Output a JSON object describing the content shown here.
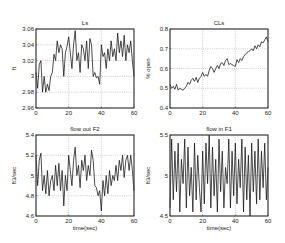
{
  "figure": {
    "background": "#ffffff",
    "line_color": "#111111"
  },
  "chart_data": [
    {
      "type": "line",
      "title": "Ls",
      "xlabel": "",
      "ylabel": "ft",
      "xlim": [
        0,
        60
      ],
      "ylim": [
        2.96,
        3.06
      ],
      "xticks": [
        0,
        20,
        40,
        60
      ],
      "xtick_labels": [
        "0",
        "20",
        "40",
        "60"
      ],
      "yticks": [
        2.96,
        2.98,
        3.0,
        3.02,
        3.04,
        3.06
      ],
      "ytick_labels": [
        "2.96",
        "2.98",
        "3",
        "3.02",
        "3.04",
        "3.06"
      ],
      "grid": true,
      "box": {
        "left": 36,
        "top": 29,
        "right": 134,
        "bottom": 108
      },
      "x": [
        0,
        1,
        2,
        3,
        4,
        5,
        6,
        7,
        8,
        9,
        10,
        11,
        12,
        13,
        14,
        15,
        16,
        17,
        18,
        19,
        20,
        21,
        22,
        23,
        24,
        25,
        26,
        27,
        28,
        29,
        30,
        31,
        32,
        33,
        34,
        35,
        36,
        37,
        38,
        39,
        40,
        41,
        42,
        43,
        44,
        45,
        46,
        47,
        48,
        49,
        50,
        51,
        52,
        53,
        54,
        55,
        56,
        57,
        58,
        59,
        60
      ],
      "values": [
        3.005,
        2.985,
        3.015,
        3.02,
        2.98,
        3.0,
        2.98,
        2.99,
        2.982,
        3.0,
        3.005,
        3.028,
        3.02,
        3.045,
        3.03,
        3.04,
        3.035,
        3.0,
        3.03,
        3.038,
        3.05,
        3.03,
        3.01,
        3.04,
        3.058,
        3.02,
        3.03,
        3.005,
        3.04,
        3.035,
        3.02,
        3.045,
        3.01,
        3.048,
        3.04,
        3.0,
        3.005,
        2.998,
        3.0,
        2.99,
        3.04,
        3.025,
        3.03,
        3.01,
        3.035,
        3.02,
        3.045,
        3.025,
        3.035,
        3.02,
        3.055,
        3.03,
        3.045,
        3.025,
        3.052,
        3.02,
        3.04,
        3.03,
        3.045,
        3.02,
        3.0
      ]
    },
    {
      "type": "line",
      "title": "CLs",
      "xlabel": "",
      "ylabel": "% open",
      "xlim": [
        0,
        60
      ],
      "ylim": [
        0.4,
        0.8
      ],
      "xticks": [
        0,
        20,
        40,
        60
      ],
      "xtick_labels": [
        "0",
        "20",
        "40",
        "60"
      ],
      "yticks": [
        0.4,
        0.5,
        0.6,
        0.7,
        0.8
      ],
      "ytick_labels": [
        "0.4",
        "0.5",
        "0.6",
        "0.7",
        "0.8"
      ],
      "grid": true,
      "box": {
        "left": 170,
        "top": 29,
        "right": 268,
        "bottom": 108
      },
      "x": [
        0,
        1,
        2,
        3,
        4,
        5,
        6,
        7,
        8,
        9,
        10,
        11,
        12,
        13,
        14,
        15,
        16,
        17,
        18,
        19,
        20,
        21,
        22,
        23,
        24,
        25,
        26,
        27,
        28,
        29,
        30,
        31,
        32,
        33,
        34,
        35,
        36,
        37,
        38,
        39,
        40,
        41,
        42,
        43,
        44,
        45,
        46,
        47,
        48,
        49,
        50,
        51,
        52,
        53,
        54,
        55,
        56,
        57,
        58,
        59,
        60
      ],
      "values": [
        0.52,
        0.5,
        0.51,
        0.495,
        0.52,
        0.49,
        0.5,
        0.495,
        0.49,
        0.5,
        0.51,
        0.53,
        0.52,
        0.54,
        0.55,
        0.535,
        0.555,
        0.53,
        0.55,
        0.56,
        0.58,
        0.56,
        0.57,
        0.56,
        0.59,
        0.61,
        0.6,
        0.58,
        0.6,
        0.615,
        0.6,
        0.625,
        0.63,
        0.615,
        0.64,
        0.65,
        0.62,
        0.625,
        0.62,
        0.615,
        0.61,
        0.645,
        0.63,
        0.65,
        0.64,
        0.66,
        0.67,
        0.68,
        0.685,
        0.69,
        0.7,
        0.69,
        0.715,
        0.7,
        0.72,
        0.71,
        0.735,
        0.73,
        0.745,
        0.76,
        0.735
      ]
    },
    {
      "type": "line",
      "title": "flow out F2",
      "xlabel": "time(sec)",
      "ylabel": "ft3/sec",
      "xlim": [
        0,
        60
      ],
      "ylim": [
        4.6,
        5.4
      ],
      "xticks": [
        0,
        20,
        40,
        60
      ],
      "xtick_labels": [
        "0",
        "20",
        "40",
        "60"
      ],
      "yticks": [
        4.6,
        4.8,
        5.0,
        5.2,
        5.4
      ],
      "ytick_labels": [
        "4.6",
        "4.8",
        "5",
        "5.2",
        "5.4"
      ],
      "grid": true,
      "box": {
        "left": 36,
        "top": 135,
        "right": 134,
        "bottom": 216
      },
      "x": [
        0,
        1,
        2,
        3,
        4,
        5,
        6,
        7,
        8,
        9,
        10,
        11,
        12,
        13,
        14,
        15,
        16,
        17,
        18,
        19,
        20,
        21,
        22,
        23,
        24,
        25,
        26,
        27,
        28,
        29,
        30,
        31,
        32,
        33,
        34,
        35,
        36,
        37,
        38,
        39,
        40,
        41,
        42,
        43,
        44,
        45,
        46,
        47,
        48,
        49,
        50,
        51,
        52,
        53,
        54,
        55,
        56,
        57,
        58,
        59,
        60
      ],
      "values": [
        5.2,
        4.9,
        5.15,
        5.22,
        4.85,
        5.0,
        4.82,
        5.05,
        4.8,
        4.95,
        5.0,
        4.85,
        5.1,
        4.9,
        5.12,
        4.85,
        5.05,
        4.7,
        5.0,
        4.85,
        5.2,
        5.05,
        4.9,
        5.15,
        5.28,
        5.0,
        5.1,
        4.88,
        5.15,
        5.05,
        5.2,
        4.95,
        5.1,
        5.0,
        5.25,
        5.15,
        4.9,
        4.88,
        4.8,
        4.85,
        4.65,
        4.95,
        4.8,
        5.0,
        4.82,
        5.05,
        4.9,
        5.0,
        4.95,
        5.1,
        4.95,
        5.15,
        5.05,
        5.2,
        4.98,
        5.15,
        5.2,
        5.05,
        5.2,
        5.05,
        4.85
      ]
    },
    {
      "type": "line",
      "title": "flow in F1",
      "xlabel": "time(sec)",
      "ylabel": "ft3/sec",
      "xlim": [
        0,
        60
      ],
      "ylim": [
        4.5,
        5.5
      ],
      "xticks": [
        0,
        20,
        40,
        60
      ],
      "xtick_labels": [
        "0",
        "20",
        "40",
        "60"
      ],
      "yticks": [
        4.5,
        5.0,
        5.5
      ],
      "ytick_labels": [
        "4.5",
        "5",
        "5.5"
      ],
      "grid": true,
      "box": {
        "left": 170,
        "top": 135,
        "right": 268,
        "bottom": 216
      },
      "x": [
        0,
        1,
        2,
        3,
        4,
        5,
        6,
        7,
        8,
        9,
        10,
        11,
        12,
        13,
        14,
        15,
        16,
        17,
        18,
        19,
        20,
        21,
        22,
        23,
        24,
        25,
        26,
        27,
        28,
        29,
        30,
        31,
        32,
        33,
        34,
        35,
        36,
        37,
        38,
        39,
        40,
        41,
        42,
        43,
        44,
        45,
        46,
        47,
        48,
        49,
        50,
        51,
        52,
        53,
        54,
        55,
        56,
        57,
        58,
        59,
        60
      ],
      "values": [
        4.6,
        5.45,
        4.7,
        5.3,
        4.8,
        5.4,
        4.55,
        5.2,
        4.9,
        5.45,
        4.6,
        5.35,
        4.75,
        5.1,
        4.55,
        5.4,
        4.7,
        5.25,
        4.85,
        4.55,
        5.3,
        4.65,
        5.4,
        4.9,
        5.5,
        4.6,
        5.35,
        4.75,
        5.2,
        4.55,
        5.45,
        4.8,
        5.3,
        4.6,
        5.1,
        4.9,
        5.45,
        4.6,
        5.3,
        4.75,
        5.4,
        4.65,
        5.2,
        4.85,
        5.45,
        4.55,
        5.35,
        4.7,
        5.25,
        4.5,
        5.4,
        4.8,
        5.3,
        4.65,
        5.45,
        4.7,
        5.3,
        4.85,
        5.4,
        4.7,
        5.1
      ]
    }
  ]
}
